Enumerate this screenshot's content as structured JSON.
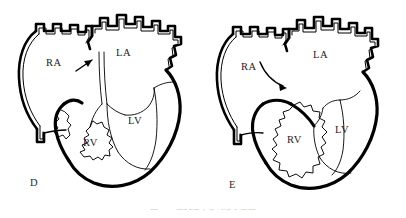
{
  "figure": {
    "type": "anatomical-line-drawing",
    "background_color": "#ffffff",
    "ink_color": "#000000",
    "caption": "图 12-4  三尖瓣下移畸形示意图",
    "panels": [
      {
        "letter": "D",
        "labels": [
          {
            "text": "RA",
            "name": "right-atrium"
          },
          {
            "text": "LA",
            "name": "left-atrium"
          },
          {
            "text": "RV",
            "name": "right-ventricle"
          },
          {
            "text": "LV",
            "name": "left-ventricle"
          }
        ],
        "annotation": {
          "name": "septum-arrow",
          "style": "short-straight",
          "direction": "up-right"
        }
      },
      {
        "letter": "E",
        "labels": [
          {
            "text": "RA",
            "name": "right-atrium"
          },
          {
            "text": "LA",
            "name": "left-atrium"
          },
          {
            "text": "RV",
            "name": "right-ventricle"
          },
          {
            "text": "LV",
            "name": "left-ventricle"
          }
        ],
        "annotation": {
          "name": "septum-arrow",
          "style": "curved",
          "direction": "down-right"
        }
      }
    ]
  }
}
